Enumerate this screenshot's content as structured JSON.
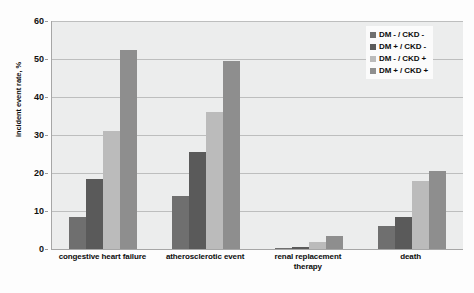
{
  "chart_data": {
    "type": "bar",
    "title": "",
    "xlabel": "",
    "ylabel": "incident event rate, %",
    "ylim": [
      0,
      60
    ],
    "yticks": [
      0,
      10,
      20,
      30,
      40,
      50,
      60
    ],
    "grid": true,
    "legend_position": "top-right",
    "categories": [
      "congestive heart failure",
      "atherosclerotic event",
      "renal replacement therapy",
      "death"
    ],
    "category_lines": [
      [
        "congestive heart failure"
      ],
      [
        "atherosclerotic event"
      ],
      [
        "renal replacement",
        "therapy"
      ],
      [
        "death"
      ]
    ],
    "series": [
      {
        "name": "DM - / CKD -",
        "color": "#6f6f6f",
        "values": [
          8.5,
          14.0,
          0.3,
          6.0
        ]
      },
      {
        "name": "DM + / CKD -",
        "color": "#5a5a5a",
        "values": [
          18.5,
          25.5,
          0.4,
          8.5
        ]
      },
      {
        "name": "DM - / CKD +",
        "color": "#bbbbbb",
        "values": [
          31.0,
          36.0,
          1.8,
          18.0
        ]
      },
      {
        "name": "DM + / CKD +",
        "color": "#8e8e8e",
        "values": [
          52.5,
          49.5,
          3.5,
          20.5
        ]
      }
    ]
  }
}
